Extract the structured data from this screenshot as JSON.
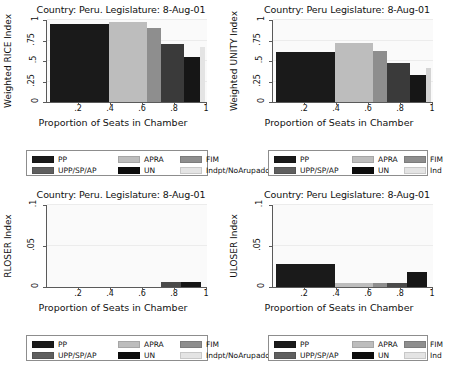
{
  "palette": {
    "PP": "#1a1a1a",
    "UPP/SP/AP": "#5f5f5f",
    "APRA": "#bdbdbd",
    "UN": "#0d0d0d",
    "FIM": "#8e8e8e",
    "Indpt": "#e4e4e4",
    "axis": "#5a5a5a",
    "grid": "#ececec",
    "plot_bg": "#fafafa",
    "legend_border": "#8d8d8d"
  },
  "panels": [
    {
      "id": "weighted-rice",
      "title": "Country: Peru. Legislature: 8-Aug-01",
      "ylabel": "Weighted RICE Index",
      "xlabel": "Proportion of Seats in Chamber"
    },
    {
      "id": "weighted-unity",
      "title": "Country: Peru Legislature: 8-Aug-01",
      "ylabel": "Weighted UNITY Index",
      "xlabel": "Proportion of Seats in Chamber"
    },
    {
      "id": "rloser",
      "title": "Country: Peru. Legislature: 8-Aug-01",
      "ylabel": "RLOSER Index",
      "xlabel": "Proportion of Seats in Chamber"
    },
    {
      "id": "uloser",
      "title": "Country: Peru Legislature: 8-Aug-01",
      "ylabel": "ULOSER Index",
      "xlabel": "Proportion of Seats in Chamber"
    }
  ],
  "legends": [
    {
      "id": "legend-top",
      "entries": [
        {
          "label": "PP",
          "color": "#1a1a1a"
        },
        {
          "label": "APRA",
          "color": "#bdbdbd"
        },
        {
          "label": "FIM",
          "color": "#8e8e8e"
        },
        {
          "label": "UPP/SP/AP",
          "color": "#5f5f5f"
        },
        {
          "label": "UN",
          "color": "#0d0d0d"
        },
        {
          "label": "Indpt/NoArupado",
          "color": "#e4e4e4"
        }
      ]
    },
    {
      "id": "legend-upper-right",
      "entries": [
        {
          "label": "PP",
          "color": "#1a1a1a"
        },
        {
          "label": "APRA",
          "color": "#bdbdbd"
        },
        {
          "label": "FIM",
          "color": "#8e8e8e"
        },
        {
          "label": "UPP/SP/AP",
          "color": "#5f5f5f"
        },
        {
          "label": "UN",
          "color": "#0d0d0d"
        },
        {
          "label": "Ind",
          "color": "#e4e4e4"
        }
      ]
    },
    {
      "id": "legend-bottom-left",
      "entries": [
        {
          "label": "PP",
          "color": "#1a1a1a"
        },
        {
          "label": "APRA",
          "color": "#bdbdbd"
        },
        {
          "label": "FIM",
          "color": "#8e8e8e"
        },
        {
          "label": "UPP/SP/AP",
          "color": "#5f5f5f"
        },
        {
          "label": "UN",
          "color": "#0d0d0d"
        },
        {
          "label": "Indpt/NoArupado",
          "color": "#e4e4e4"
        }
      ]
    },
    {
      "id": "legend-bottom-right",
      "entries": [
        {
          "label": "PP",
          "color": "#1a1a1a"
        },
        {
          "label": "APRA",
          "color": "#bdbdbd"
        },
        {
          "label": "FIM",
          "color": "#8e8e8e"
        },
        {
          "label": "UPP/SP/AP",
          "color": "#5f5f5f"
        },
        {
          "label": "UN",
          "color": "#0d0d0d"
        },
        {
          "label": "Ind",
          "color": "#e4e4e4"
        }
      ]
    }
  ],
  "chart_data": [
    {
      "type": "bar",
      "id": "weighted-rice",
      "title": "Country: Peru. Legislature: 8-Aug-01",
      "xlabel": "Proportion of Seats in Chamber",
      "ylabel": "Weighted RICE Index",
      "xlim": [
        0,
        1
      ],
      "ylim": [
        0,
        1
      ],
      "xticks": [
        ".2",
        ".4",
        ".6",
        ".8",
        "1"
      ],
      "xtick_values": [
        0.2,
        0.4,
        0.6,
        0.8,
        1
      ],
      "yticks": [
        "0",
        ".25",
        ".5",
        ".75",
        "1"
      ],
      "ytick_values": [
        0,
        0.25,
        0.5,
        0.75,
        1
      ],
      "grid": true,
      "legend_position": "below",
      "note": "Variable-width bars: width = party seat share, height = index value",
      "bars": [
        {
          "party": "PP",
          "x_start": 0.02,
          "x_end": 0.385,
          "value": 0.955,
          "color": "#1a1a1a"
        },
        {
          "party": "APRA",
          "x_start": 0.385,
          "x_end": 0.625,
          "value": 0.975,
          "color": "#bdbdbd"
        },
        {
          "party": "FIM",
          "x_start": 0.625,
          "x_end": 0.71,
          "value": 0.905,
          "color": "#8e8e8e"
        },
        {
          "party": "UN",
          "x_start": 0.71,
          "x_end": 0.855,
          "value": 0.71,
          "color": "#3a3a3a"
        },
        {
          "party": "PP2",
          "x_start": 0.855,
          "x_end": 0.955,
          "value": 0.555,
          "color": "#161616"
        },
        {
          "party": "Indpt",
          "x_start": 0.955,
          "x_end": 0.985,
          "value": 0.67,
          "color": "#e4e4e4"
        }
      ]
    },
    {
      "type": "bar",
      "id": "weighted-unity",
      "title": "Country: Peru Legislature: 8-Aug-01",
      "xlabel": "Proportion of Seats in Chamber",
      "ylabel": "Weighted UNITY Index",
      "xlim": [
        0,
        1
      ],
      "ylim": [
        0,
        1
      ],
      "xticks": [
        ".2",
        ".4",
        ".6",
        ".8",
        "1"
      ],
      "xtick_values": [
        0.2,
        0.4,
        0.6,
        0.8,
        1
      ],
      "yticks": [
        "0",
        ".25",
        ".5",
        ".75",
        "1"
      ],
      "ytick_values": [
        0,
        0.25,
        0.5,
        0.75,
        1
      ],
      "grid": true,
      "legend_position": "below",
      "bars": [
        {
          "party": "PP",
          "x_start": 0.02,
          "x_end": 0.385,
          "value": 0.605,
          "color": "#1a1a1a"
        },
        {
          "party": "APRA",
          "x_start": 0.385,
          "x_end": 0.625,
          "value": 0.725,
          "color": "#bdbdbd"
        },
        {
          "party": "FIM",
          "x_start": 0.625,
          "x_end": 0.71,
          "value": 0.62,
          "color": "#8e8e8e"
        },
        {
          "party": "UN",
          "x_start": 0.71,
          "x_end": 0.855,
          "value": 0.48,
          "color": "#3a3a3a"
        },
        {
          "party": "PP2",
          "x_start": 0.855,
          "x_end": 0.955,
          "value": 0.335,
          "color": "#161616"
        },
        {
          "party": "Ind",
          "x_start": 0.955,
          "x_end": 0.985,
          "value": 0.415,
          "color": "#d4d4d4"
        }
      ]
    },
    {
      "type": "bar",
      "id": "rloser",
      "title": "Country: Peru. Legislature: 8-Aug-01",
      "xlabel": "Proportion of Seats in Chamber",
      "ylabel": "RLOSER Index",
      "xlim": [
        0,
        1
      ],
      "ylim": [
        0,
        0.1
      ],
      "xticks": [
        ".2",
        ".4",
        ".6",
        ".8",
        "1"
      ],
      "xtick_values": [
        0.2,
        0.4,
        0.6,
        0.8,
        1
      ],
      "yticks": [
        "0",
        ".05",
        ".1"
      ],
      "ytick_values": [
        0,
        0.05,
        0.1
      ],
      "grid": true,
      "legend_position": "below",
      "bars": [
        {
          "party": "PP",
          "x_start": 0.02,
          "x_end": 0.385,
          "value": 0.0,
          "color": "#1a1a1a"
        },
        {
          "party": "APRA",
          "x_start": 0.385,
          "x_end": 0.625,
          "value": 0.0,
          "color": "#bdbdbd"
        },
        {
          "party": "FIM",
          "x_start": 0.625,
          "x_end": 0.71,
          "value": 0.0,
          "color": "#8e8e8e"
        },
        {
          "party": "UN",
          "x_start": 0.71,
          "x_end": 0.835,
          "value": 0.006,
          "color": "#4a4a4a"
        },
        {
          "party": "PP2",
          "x_start": 0.835,
          "x_end": 0.96,
          "value": 0.006,
          "color": "#161616"
        }
      ]
    },
    {
      "type": "bar",
      "id": "uloser",
      "title": "Country: Peru Legislature: 8-Aug-01",
      "xlabel": "Proportion of Seats in Chamber",
      "ylabel": "ULOSER Index",
      "xlim": [
        0,
        1
      ],
      "ylim": [
        0,
        0.1
      ],
      "xticks": [
        ".2",
        ".4",
        ".6",
        ".8",
        "1"
      ],
      "xtick_values": [
        0.2,
        0.4,
        0.6,
        0.8,
        1
      ],
      "yticks": [
        "0",
        ".05",
        ".1"
      ],
      "ytick_values": [
        0,
        0.05,
        0.1
      ],
      "grid": true,
      "legend_position": "below",
      "bars": [
        {
          "party": "PP",
          "x_start": 0.02,
          "x_end": 0.385,
          "value": 0.0275,
          "color": "#1a1a1a"
        },
        {
          "party": "APRA",
          "x_start": 0.385,
          "x_end": 0.625,
          "value": 0.0045,
          "color": "#bdbdbd"
        },
        {
          "party": "FIM",
          "x_start": 0.625,
          "x_end": 0.71,
          "value": 0.0045,
          "color": "#8e8e8e"
        },
        {
          "party": "UN",
          "x_start": 0.71,
          "x_end": 0.835,
          "value": 0.0055,
          "color": "#4a4a4a"
        },
        {
          "party": "PP2",
          "x_start": 0.835,
          "x_end": 0.96,
          "value": 0.018,
          "color": "#161616"
        }
      ]
    }
  ]
}
